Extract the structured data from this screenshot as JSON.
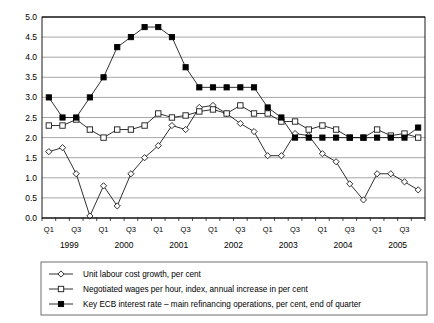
{
  "chart_data": {
    "type": "line",
    "title": "",
    "subtitle": "",
    "xlabel": "",
    "ylabel": "",
    "ylim": [
      0.0,
      5.0
    ],
    "ytick_step": 0.5,
    "grid": true,
    "legend_position": "bottom",
    "ytick_labels": [
      "0.0",
      "0.5",
      "1.0",
      "1.5",
      "2.0",
      "2.5",
      "3.0",
      "3.5",
      "4.0",
      "4.5",
      "5.0"
    ],
    "x": [
      "1999 Q1",
      "1999 Q2",
      "1999 Q3",
      "1999 Q4",
      "2000 Q1",
      "2000 Q2",
      "2000 Q3",
      "2000 Q4",
      "2001 Q1",
      "2001 Q2",
      "2001 Q3",
      "2001 Q4",
      "2002 Q1",
      "2002 Q2",
      "2002 Q3",
      "2002 Q4",
      "2003 Q1",
      "2003 Q2",
      "2003 Q3",
      "2003 Q4",
      "2004 Q1",
      "2004 Q2",
      "2004 Q3",
      "2004 Q4",
      "2005 Q1",
      "2005 Q2",
      "2005 Q3",
      "2005 Q4"
    ],
    "xtick_labels": [
      "Q1",
      "Q3",
      "Q1",
      "Q3",
      "Q1",
      "Q3",
      "Q1",
      "Q3",
      "Q1",
      "Q3",
      "Q1",
      "Q3",
      "Q1",
      "Q3"
    ],
    "year_labels": [
      "1999",
      "2000",
      "2001",
      "2002",
      "2003",
      "2004",
      "2005"
    ],
    "series": [
      {
        "name": "Unit labour cost growth, per cent",
        "marker": "open-diamond",
        "values": [
          1.65,
          1.75,
          1.1,
          0.05,
          0.8,
          0.3,
          1.1,
          1.5,
          1.8,
          2.3,
          2.2,
          2.75,
          2.8,
          2.6,
          2.35,
          2.15,
          1.55,
          1.55,
          2.1,
          2.05,
          1.6,
          1.4,
          0.85,
          0.45,
          1.1,
          1.1,
          0.9,
          0.7
        ]
      },
      {
        "name": "Negotiated wages per hour, index, annual increase in per cent",
        "marker": "open-square",
        "values": [
          2.3,
          2.3,
          2.45,
          2.2,
          2.0,
          2.2,
          2.2,
          2.3,
          2.6,
          2.5,
          2.55,
          2.65,
          2.7,
          2.6,
          2.8,
          2.6,
          2.6,
          2.4,
          2.4,
          2.2,
          2.3,
          2.2,
          2.0,
          2.0,
          2.2,
          2.05,
          2.1,
          2.0
        ]
      },
      {
        "name": "Key ECB interest rate – main refinancing operations, per cent, end of quarter",
        "marker": "filled-square",
        "values": [
          3.0,
          2.5,
          2.5,
          3.0,
          3.5,
          4.25,
          4.5,
          4.75,
          4.75,
          4.5,
          3.75,
          3.25,
          3.25,
          3.25,
          3.25,
          3.25,
          2.75,
          2.5,
          2.0,
          2.0,
          2.0,
          2.0,
          2.0,
          2.0,
          2.0,
          2.0,
          2.0,
          2.25
        ]
      }
    ]
  },
  "legend": {
    "items": [
      {
        "label": "Unit labour cost growth, per cent",
        "marker": "open-diamond"
      },
      {
        "label": "Negotiated wages per hour, index, annual increase in per cent",
        "marker": "open-square"
      },
      {
        "label": "Key ECB interest rate – main refinancing operations, per cent, end of quarter",
        "marker": "filled-square"
      }
    ]
  },
  "colors": {
    "line": "#1a1a1a",
    "grid": "#8f8f8f",
    "axis": "#000000",
    "background": "#ffffff"
  }
}
